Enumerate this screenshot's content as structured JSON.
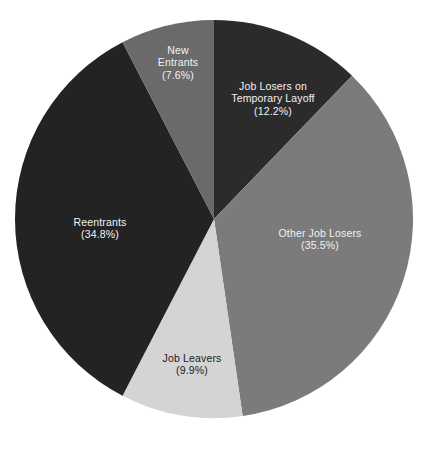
{
  "chart_data": {
    "type": "pie",
    "title": "",
    "subtitle": "",
    "xlabel": "",
    "ylabel": "",
    "grid": false,
    "legend_position": "none",
    "labels_inside_slices": true,
    "total_percent": "100.0%",
    "background_color": "#ffffff",
    "categories": [
      "Job Losers on Temporary Layoff",
      "Other Job Losers",
      "Job Leavers",
      "Reentrants",
      "New Entrants"
    ],
    "values": [
      12.2,
      35.5,
      9.9,
      34.8,
      7.6
    ],
    "colors": [
      "#2b2b2b",
      "#7b7b7b",
      "#d4d4d4",
      "#232323",
      "#6a6a6a"
    ],
    "slices": [
      {
        "name": "Job Losers on Temporary Layoff",
        "value": 12.2,
        "label_line1": "Job Losers on",
        "label_line2": "Temporary Layoff",
        "percent_label": "(12.2%)",
        "color": "#2b2b2b",
        "text_color": "#f2f2f2",
        "text_on": "dark",
        "label_x": 273,
        "label_y": 98
      },
      {
        "name": "Other Job Losers",
        "value": 35.5,
        "label_line1": "Other Job Losers",
        "label_line2": "",
        "percent_label": "(35.5%)",
        "color": "#7b7b7b",
        "text_color": "#f2f2f2",
        "text_on": "dark",
        "label_x": 320,
        "label_y": 239
      },
      {
        "name": "Job Leavers",
        "value": 9.9,
        "label_line1": "Job Leavers",
        "label_line2": "",
        "percent_label": "(9.9%)",
        "color": "#d4d4d4",
        "text_color": "#1c1c1c",
        "text_on": "light",
        "label_x": 192,
        "label_y": 364
      },
      {
        "name": "Reentrants",
        "value": 34.8,
        "label_line1": "Reentrants",
        "label_line2": "",
        "percent_label": "(34.8%)",
        "color": "#232323",
        "text_color": "#f2f2f2",
        "text_on": "dark",
        "label_x": 100,
        "label_y": 228
      },
      {
        "name": "New Entrants",
        "value": 7.6,
        "label_line1": "New",
        "label_line2": "Entrants",
        "percent_label": "(7.6%)",
        "color": "#6a6a6a",
        "text_color": "#f2f2f2",
        "text_on": "dark",
        "label_x": 178,
        "label_y": 62
      }
    ],
    "geometry": {
      "center_x": 214,
      "center_y": 219,
      "radius": 199,
      "start_angle_deg": 0,
      "direction": "clockwise"
    }
  }
}
